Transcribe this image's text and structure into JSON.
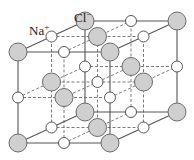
{
  "diagram": {
    "labels": {
      "cl": {
        "text": "Cl",
        "charge": "−",
        "x": 74,
        "y": 22
      },
      "na": {
        "text": "Na",
        "charge": "+",
        "x": 29,
        "y": 35
      }
    },
    "geometry": {
      "origin": [
        18,
        143
      ],
      "x_vec": [
        92,
        0
      ],
      "depth_vec": [
        67,
        -31
      ],
      "height_vec": [
        0,
        -91
      ]
    },
    "atoms": {
      "cl": {
        "name": "Cl−",
        "radius": 9,
        "fill": "#cfcfcf",
        "stroke": "#6a6a6a"
      },
      "na": {
        "name": "Na+",
        "radius": 5.5,
        "fill": "#ffffff",
        "stroke": "#555555"
      }
    },
    "colors": {
      "line": "#555555",
      "dashed": "#7a7a7a"
    }
  }
}
